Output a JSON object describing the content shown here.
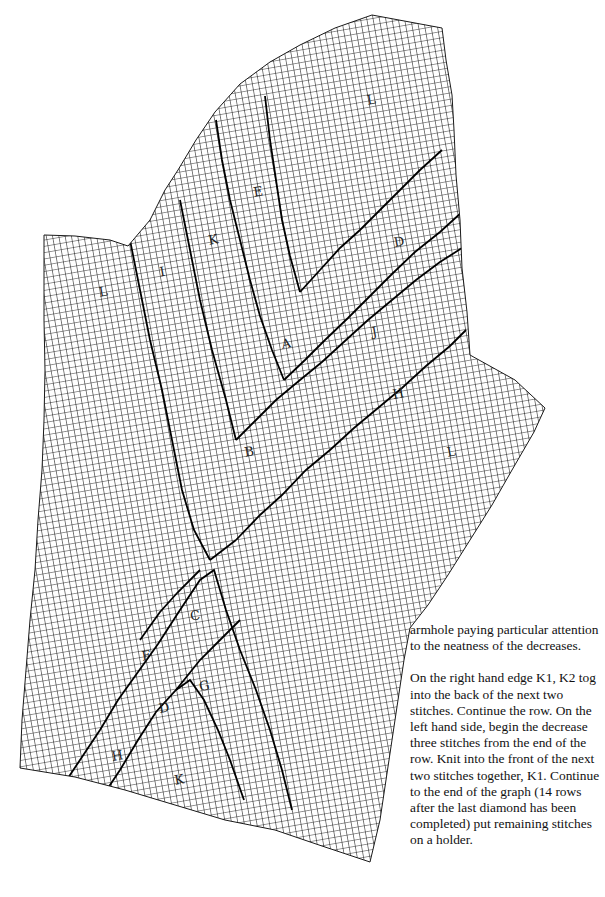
{
  "chart_data": {
    "type": "knitting-chart",
    "grid": {
      "cell_size_px": 6.2,
      "rotation_deg": -10,
      "line_color": "#1a1a1a",
      "motif_line_color": "#000000"
    },
    "region_labels": [
      {
        "letter": "L",
        "x": 372,
        "y": 104
      },
      {
        "letter": "E",
        "x": 259,
        "y": 196
      },
      {
        "letter": "K",
        "x": 214,
        "y": 244
      },
      {
        "letter": "D",
        "x": 400,
        "y": 246
      },
      {
        "letter": "I",
        "x": 163,
        "y": 276
      },
      {
        "letter": "L",
        "x": 104,
        "y": 296
      },
      {
        "letter": "J",
        "x": 375,
        "y": 336
      },
      {
        "letter": "A",
        "x": 287,
        "y": 348
      },
      {
        "letter": "H",
        "x": 399,
        "y": 398
      },
      {
        "letter": "B",
        "x": 250,
        "y": 456
      },
      {
        "letter": "L",
        "x": 452,
        "y": 456
      },
      {
        "letter": "C",
        "x": 196,
        "y": 620
      },
      {
        "letter": "F",
        "x": 147,
        "y": 660
      },
      {
        "letter": "G",
        "x": 205,
        "y": 690
      },
      {
        "letter": "D",
        "x": 165,
        "y": 712
      },
      {
        "letter": "H",
        "x": 118,
        "y": 760
      },
      {
        "letter": "K",
        "x": 180,
        "y": 784
      }
    ]
  },
  "instructions": {
    "paragraphs": [
      "armhole paying particular attention to the neatness of the decreases.",
      "On the right hand edge K1, K2 tog into the back of the next two stitches. Continue the row. On the left hand side, begin the decrease three stitches from the end of the row. Knit into the front of the next two stitches together, K1. Continue to the end of the graph (14 rows after the last diamond has been completed) put  remaining stitches on a holder."
    ]
  }
}
